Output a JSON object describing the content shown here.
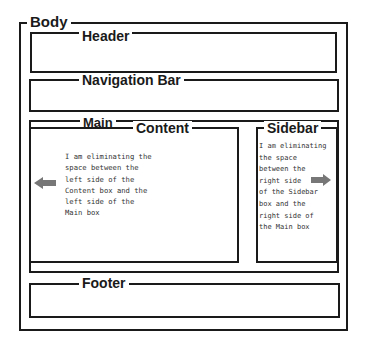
{
  "diagram": {
    "body": {
      "label": "Body"
    },
    "header": {
      "label": "Header"
    },
    "nav": {
      "label": "Navigation Bar"
    },
    "main": {
      "label": "Main"
    },
    "content": {
      "label": "Content",
      "note": "I am eliminating the\nspace between the\nleft side of the\nContent box and the\nleft side of the\nMain box",
      "arrow_direction": "left"
    },
    "sidebar": {
      "label": "Sidebar",
      "note": "I am eliminating\nthe space\nbetween the\nright side\nof the Sidebar\nbox and the\nright side of\nthe Main box",
      "arrow_direction": "right"
    },
    "footer": {
      "label": "Footer"
    },
    "colors": {
      "line": "#1a1a1a",
      "arrow": "#777777",
      "note_text": "#333333"
    }
  }
}
